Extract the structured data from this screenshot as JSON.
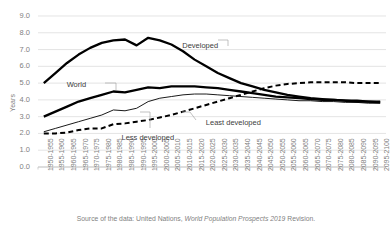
{
  "chart_data": {
    "type": "line",
    "title": "",
    "xlabel": "",
    "ylabel": "Years",
    "ylim": [
      0.0,
      9.0
    ],
    "ytick_labels": [
      "0.0",
      "1.0",
      "2.0",
      "3.0",
      "4.0",
      "5.0",
      "6.0",
      "7.0",
      "8.0",
      "9.0"
    ],
    "ytick_values": [
      0.0,
      1.0,
      2.0,
      3.0,
      4.0,
      5.0,
      6.0,
      7.0,
      8.0,
      9.0
    ],
    "grid": true,
    "legend_position": "inline-annotations",
    "categories": [
      "1950-1955",
      "1955-1960",
      "1960-1965",
      "1965-1970",
      "1970-1975",
      "1975-1980",
      "1980-1985",
      "1985-1990",
      "1990-1995",
      "1995-2000",
      "2000-2005",
      "2005-2010",
      "2010-2015",
      "2015-2020",
      "2020-2025",
      "2025-2030",
      "2030-2035",
      "2035-2040",
      "2040-2045",
      "2045-2050",
      "2050-2055",
      "2055-2060",
      "2060-2065",
      "2065-2070",
      "2070-2075",
      "2075-2080",
      "2080-2085",
      "2085-2090",
      "2090-2095",
      "2095-2100"
    ],
    "series": [
      {
        "name": "Developed",
        "style": "thick-solid",
        "color": "#000000",
        "values": [
          5.0,
          5.6,
          6.2,
          6.7,
          7.1,
          7.4,
          7.55,
          7.6,
          7.25,
          7.7,
          7.55,
          7.3,
          6.9,
          6.4,
          6.0,
          5.6,
          5.3,
          5.0,
          4.8,
          4.6,
          4.45,
          4.3,
          4.2,
          4.1,
          4.05,
          4.0,
          3.95,
          3.9,
          3.9,
          3.85
        ]
      },
      {
        "name": "World",
        "style": "thick-solid",
        "color": "#000000",
        "values": [
          3.0,
          3.3,
          3.6,
          3.9,
          4.1,
          4.3,
          4.5,
          4.45,
          4.6,
          4.75,
          4.7,
          4.8,
          4.8,
          4.8,
          4.75,
          4.7,
          4.6,
          4.5,
          4.4,
          4.3,
          4.2,
          4.15,
          4.1,
          4.05,
          4.0,
          4.0,
          3.95,
          3.95,
          3.9,
          3.9
        ]
      },
      {
        "name": "Less developed",
        "style": "thin-solid",
        "color": "#000000",
        "values": [
          2.1,
          2.3,
          2.5,
          2.7,
          2.9,
          3.1,
          3.4,
          3.35,
          3.5,
          3.9,
          4.1,
          4.2,
          4.3,
          4.35,
          4.35,
          4.3,
          4.25,
          4.2,
          4.15,
          4.1,
          4.05,
          4.0,
          3.95,
          3.95,
          3.9,
          3.9,
          3.85,
          3.85,
          3.8,
          3.8
        ]
      },
      {
        "name": "Least developed",
        "style": "dashed",
        "color": "#000000",
        "values": [
          2.0,
          2.0,
          2.05,
          2.2,
          2.3,
          2.3,
          2.55,
          2.6,
          2.7,
          2.8,
          2.95,
          3.1,
          3.3,
          3.5,
          3.7,
          3.9,
          4.1,
          4.3,
          4.5,
          4.7,
          4.85,
          4.95,
          5.0,
          5.05,
          5.05,
          5.05,
          5.05,
          5.0,
          5.0,
          5.0
        ]
      }
    ],
    "annotations": [
      {
        "text": "Developed",
        "x_pct": 46.5,
        "y_pct": 18.0
      },
      {
        "text": "World",
        "x_pct": 17.0,
        "y_pct": 35.5
      },
      {
        "text": "Less developed",
        "x_pct": 31.0,
        "y_pct": 59.0
      },
      {
        "text": "Least developed",
        "x_pct": 52.5,
        "y_pct": 52.5
      }
    ]
  },
  "source": {
    "prefix": "Source of the data: United Nations, ",
    "italic": "World Population Prospects 2019",
    "suffix": " Revision."
  }
}
